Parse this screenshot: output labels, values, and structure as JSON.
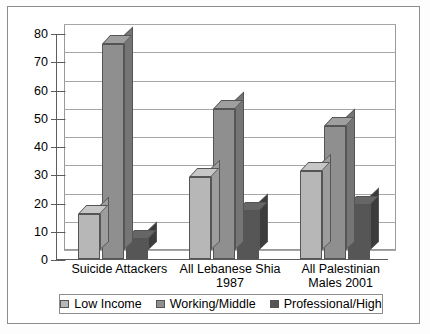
{
  "chart_data": {
    "type": "bar",
    "title": "",
    "subtitle": "",
    "xlabel": "",
    "ylabel": "",
    "ylim": [
      0,
      80
    ],
    "ytick_step": 10,
    "yticks": [
      "80",
      "70",
      "60",
      "50",
      "40",
      "30",
      "20",
      "10",
      "0"
    ],
    "grid": true,
    "legend_position": "bottom",
    "style": "3d-clustered-column",
    "categories": [
      "Suicide Attackers",
      "All Lebanese Shia 1987",
      "All Palestinian Males 2001"
    ],
    "category_lines": [
      [
        "Suicide Attackers"
      ],
      [
        "All Lebanese Shia",
        "1987"
      ],
      [
        "All Palestinian",
        "Males 2001"
      ]
    ],
    "series": [
      {
        "name": "Low Income",
        "color": "#b7b7b7",
        "values": [
          16,
          29,
          31
        ]
      },
      {
        "name": "Working/Middle",
        "color": "#8f8f8f",
        "values": [
          76,
          53,
          47
        ]
      },
      {
        "name": "Professional/High",
        "color": "#565656",
        "values": [
          7,
          17,
          19
        ]
      }
    ]
  },
  "legend": {
    "items": [
      {
        "label": "Low Income"
      },
      {
        "label": "Working/Middle"
      },
      {
        "label": "Professional/High"
      }
    ]
  },
  "colors": {
    "low_income": "#b7b7b7",
    "working_middle": "#8f8f8f",
    "professional_high": "#565656",
    "axis": "#5d5d5d",
    "grid": "#a6a6a6",
    "frame": "#8d8d8d",
    "bar_outline": "#555555",
    "background": "#ffffff"
  }
}
